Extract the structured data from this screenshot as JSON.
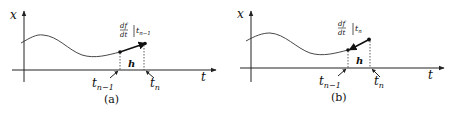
{
  "figure": {
    "panels": [
      {
        "id": "a",
        "caption": "(a)",
        "y_axis_label": "x",
        "x_axis_label": "t",
        "step_label": "h",
        "left_tick_label": {
          "base": "t",
          "sub": "n−1"
        },
        "right_tick_label": {
          "base": "t",
          "sub": "n"
        },
        "derivative_label": {
          "num": "df",
          "den": "dt",
          "eval_at": {
            "base": "t",
            "sub": "n−1"
          }
        },
        "description": "Derivative evaluated at t_{n-1}, step extrapolated forward to t_n"
      },
      {
        "id": "b",
        "caption": "(b)",
        "y_axis_label": "x",
        "x_axis_label": "t",
        "step_label": "h",
        "left_tick_label": {
          "base": "t",
          "sub": "n−1"
        },
        "right_tick_label": {
          "base": "t",
          "sub": "n"
        },
        "derivative_label": {
          "num": "df",
          "den": "dt",
          "eval_at": {
            "base": "t",
            "sub": "n"
          }
        },
        "description": "Derivative evaluated at t_n, line traced back to t_{n-1}"
      }
    ],
    "colors": {
      "ink": "#111111",
      "background": "#ffffff"
    }
  }
}
